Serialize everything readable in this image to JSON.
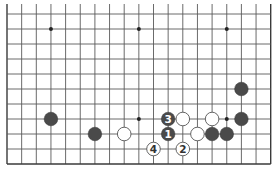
{
  "board": {
    "columns": 19,
    "rows": 11,
    "origin_x": 7,
    "origin_y": 14,
    "spacing_x": 14.65,
    "spacing_y": 15,
    "edges": {
      "left": true,
      "right": true,
      "bottom": true,
      "top": false
    },
    "line_color": "#5a5a5a",
    "edge_color": "#3a3a3a",
    "background": "#ffffff"
  },
  "star_points": [
    {
      "col": 3,
      "row": 1
    },
    {
      "col": 9,
      "row": 1
    },
    {
      "col": 15,
      "row": 1
    },
    {
      "col": 9,
      "row": 7
    },
    {
      "col": 15,
      "row": 7
    }
  ],
  "stones": [
    {
      "color": "black",
      "col": 3,
      "row": 7,
      "label": ""
    },
    {
      "color": "black",
      "col": 6,
      "row": 8,
      "label": ""
    },
    {
      "color": "white",
      "col": 8,
      "row": 8,
      "label": ""
    },
    {
      "color": "black",
      "col": 11,
      "row": 7,
      "label": "3"
    },
    {
      "color": "black",
      "col": 11,
      "row": 8,
      "label": "1"
    },
    {
      "color": "white",
      "col": 12,
      "row": 7,
      "label": ""
    },
    {
      "color": "white",
      "col": 13,
      "row": 8,
      "label": ""
    },
    {
      "color": "white",
      "col": 14,
      "row": 7,
      "label": ""
    },
    {
      "color": "black",
      "col": 14,
      "row": 8,
      "label": ""
    },
    {
      "color": "black",
      "col": 15,
      "row": 8,
      "label": ""
    },
    {
      "color": "black",
      "col": 16,
      "row": 7,
      "label": ""
    },
    {
      "color": "black",
      "col": 16,
      "row": 5,
      "label": ""
    },
    {
      "color": "white",
      "col": 10,
      "row": 9,
      "label": "4"
    },
    {
      "color": "white",
      "col": 12,
      "row": 9,
      "label": "2"
    }
  ],
  "colors": {
    "black_stone": "#4a4a4a",
    "white_stone": "#ffffff",
    "white_stone_border": "#555555",
    "black_label": "#ffffff",
    "white_label": "#333333"
  }
}
